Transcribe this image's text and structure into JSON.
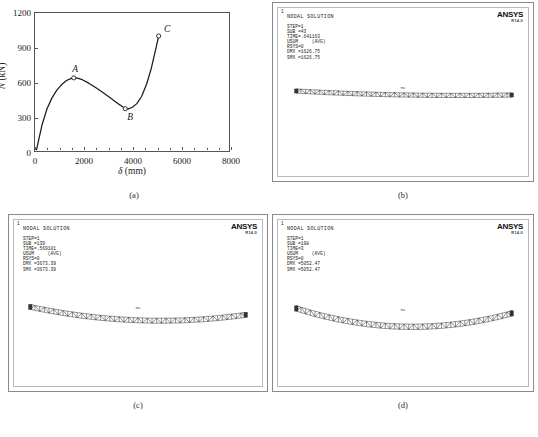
{
  "figure": {
    "captions": {
      "a": "(a)",
      "b": "(b)",
      "c": "(c)",
      "d": "(d)"
    }
  },
  "chart_data": {
    "type": "line",
    "title": "",
    "xlabel": "δ (mm)",
    "xlabel_symbol": "δ",
    "xlabel_unit": "(mm)",
    "ylabel": "N (kN)",
    "ylabel_symbol": "N",
    "ylabel_unit": "(kN)",
    "xlim": [
      0,
      8000
    ],
    "ylim": [
      0,
      1200
    ],
    "xticks": [
      0,
      2000,
      4000,
      6000,
      8000
    ],
    "xtick_labels": [
      "0",
      "2000",
      "4000",
      "6000",
      "8000"
    ],
    "yticks": [
      0,
      300,
      600,
      900,
      1200
    ],
    "ytick_labels": [
      "0",
      "300",
      "600",
      "900",
      "1200"
    ],
    "grid": false,
    "legend": false,
    "series": [
      {
        "name": "load-displacement",
        "x": [
          60,
          150,
          300,
          500,
          700,
          900,
          1100,
          1300,
          1500,
          1600,
          1750,
          1950,
          2200,
          2500,
          2800,
          3100,
          3400,
          3600,
          3720,
          3850,
          4000,
          4200,
          4400,
          4600,
          4800,
          5000,
          5100
        ],
        "y": [
          8,
          95,
          235,
          370,
          462,
          530,
          578,
          613,
          632,
          636,
          633,
          620,
          592,
          552,
          508,
          462,
          416,
          386,
          368,
          366,
          378,
          412,
          476,
          580,
          722,
          905,
          1000
        ]
      }
    ],
    "annotations": [
      {
        "label": "A",
        "x": 1600,
        "y": 636,
        "marker": "open-circle",
        "label_position": "above-left"
      },
      {
        "label": "B",
        "x": 3720,
        "y": 368,
        "marker": "open-circle",
        "label_position": "below-right"
      },
      {
        "label": "C",
        "x": 5100,
        "y": 1000,
        "marker": "open-circle",
        "label_position": "right"
      }
    ]
  },
  "panels": {
    "b": {
      "corner_number": "1",
      "title": "NODAL SOLUTION",
      "stats": [
        "STEP=1",
        "SUB =43",
        "TIME=.641163",
        "USUM     (AVG)",
        "RSYS=0",
        "DMX =1626.75",
        "SMX =1626.75"
      ],
      "logo": "ANSYS",
      "version": "R14.0",
      "mx_tag": "MX"
    },
    "c": {
      "corner_number": "1",
      "title": "NODAL SOLUTION",
      "stats": [
        "STEP=1",
        "SUB =139",
        "TIME=.569101",
        "USUM     (AVG)",
        "RSYS=0",
        "DMX =3673.39",
        "SMX =3673.39"
      ],
      "logo": "ANSYS",
      "version": "R14.0",
      "mx_tag": "MX"
    },
    "d": {
      "corner_number": "1",
      "title": "NODAL SOLUTION",
      "stats": [
        "STEP=1",
        "SUB =198",
        "TIME=3",
        "USUM     (AVG)",
        "RSYS=0",
        "DMX =5052.47",
        "SMX =5052.47"
      ],
      "logo": "ANSYS",
      "version": "R14.0",
      "mx_tag": "MX"
    }
  }
}
